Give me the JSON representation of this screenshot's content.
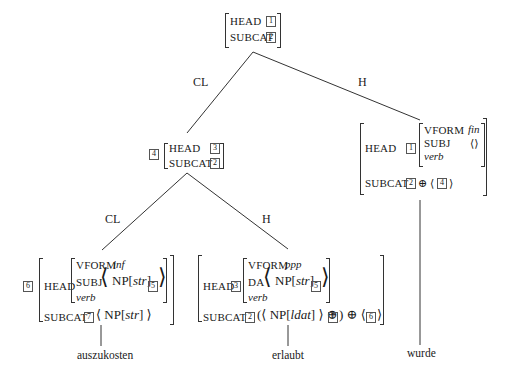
{
  "tree": {
    "root": {
      "rows": [
        {
          "attr": "HEAD",
          "tag": "1"
        },
        {
          "attr": "SUBCAT",
          "tag": "2"
        }
      ]
    },
    "edges": {
      "root_left": "CL",
      "root_right": "H",
      "mid_left": "CL",
      "mid_right": "H"
    },
    "mid": {
      "tag": "4",
      "rows": [
        {
          "attr": "HEAD",
          "tag": "3"
        },
        {
          "attr": "SUBCAT",
          "tag": "2"
        }
      ]
    },
    "head_wurde": {
      "head_attr": "HEAD",
      "head_tag": "1",
      "vform_attr": "VFORM",
      "vform_val": "fin",
      "subj_attr": "SUBJ",
      "subj_val": "⟨⟩",
      "type": "verb",
      "subcat_attr": "SUBCAT",
      "subcat_tag": "2",
      "subcat_op": "⊕",
      "subcat_list_tag": "4"
    },
    "auszukosten": {
      "tag": "6",
      "head_attr": "HEAD",
      "vform_attr": "VFORM",
      "vform_val": "inf",
      "subj_attr": "SUBJ",
      "subj_np": "NP[",
      "subj_case": "str",
      "subj_close": "]",
      "subj_tag": "5",
      "type": "verb",
      "subcat_attr": "SUBCAT",
      "subcat_tag": "7",
      "subcat_np": "NP[",
      "subcat_case": "str",
      "subcat_close": "]"
    },
    "erlaubt": {
      "head_attr": "HEAD",
      "head_tag": "3",
      "vform_attr": "VFORM",
      "vform_val": "ppp",
      "da_attr": "DA",
      "da_np": "NP[",
      "da_case": "str",
      "da_close": "]",
      "da_tag": "5",
      "type": "verb",
      "subcat_attr": "SUBCAT",
      "subcat_tag": "2",
      "subcat_np": "NP[",
      "subcat_case": "ldat",
      "subcat_close": "]",
      "subcat_tag2": "7",
      "subcat_tag3": "6",
      "op": "⊕"
    },
    "words": [
      "auszukosten",
      "erlaubt",
      "wurde"
    ]
  }
}
